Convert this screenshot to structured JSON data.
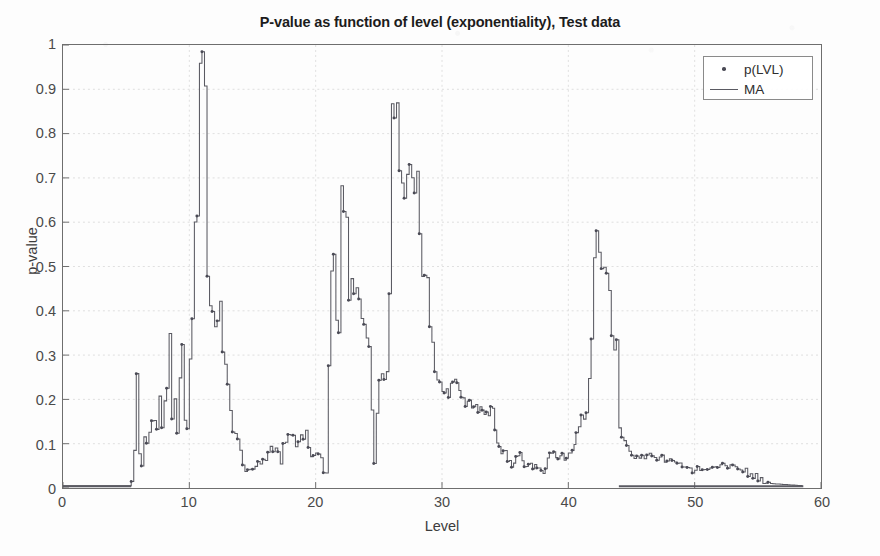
{
  "chart_data": {
    "type": "line",
    "title": "P-value as function of level (exponentiality), Test data",
    "xlabel": "Level",
    "ylabel": "p-value",
    "xlim": [
      0,
      60
    ],
    "ylim": [
      0,
      1
    ],
    "xticks": [
      0,
      10,
      20,
      30,
      40,
      50,
      60
    ],
    "yticks": [
      0,
      0.1,
      0.2,
      0.3,
      0.4,
      0.5,
      0.6,
      0.7,
      0.8,
      0.9,
      1
    ],
    "grid": true,
    "legend_position": "top-right",
    "legend": [
      "p(LVL)",
      "MA"
    ],
    "series": [
      {
        "name": "p(LVL)",
        "marker": "dot",
        "style": "markers",
        "color": "#4a4a55"
      },
      {
        "name": "MA",
        "marker": "none",
        "style": "line",
        "color": "#5a5a62"
      }
    ],
    "x": [
      0.0,
      0.5,
      1.0,
      1.5,
      2.0,
      2.5,
      3.0,
      3.5,
      4.0,
      4.5,
      5.0,
      5.4,
      5.6,
      5.8,
      6.0,
      6.2,
      6.4,
      6.6,
      6.8,
      7.0,
      7.2,
      7.4,
      7.6,
      7.8,
      8.0,
      8.2,
      8.4,
      8.6,
      8.8,
      9.0,
      9.2,
      9.4,
      9.6,
      9.8,
      10.0,
      10.2,
      10.4,
      10.6,
      10.8,
      11.0,
      11.2,
      11.4,
      11.6,
      11.8,
      12.0,
      12.2,
      12.4,
      12.6,
      12.8,
      13.0,
      13.2,
      13.4,
      13.6,
      13.8,
      14.0,
      14.4,
      14.8,
      15.2,
      15.6,
      16.0,
      16.4,
      16.8,
      17.2,
      17.6,
      18.0,
      18.4,
      18.8,
      19.2,
      19.6,
      20.0,
      20.4,
      20.8,
      21.0,
      21.2,
      21.4,
      21.6,
      21.8,
      22.0,
      22.2,
      22.4,
      22.6,
      22.8,
      23.0,
      23.4,
      23.8,
      24.2,
      24.6,
      25.0,
      25.2,
      25.4,
      25.6,
      25.8,
      26.0,
      26.4,
      26.8,
      27.2,
      27.6,
      28.0,
      28.4,
      28.8,
      29.2,
      29.6,
      30.0,
      30.5,
      31.0,
      31.5,
      32.0,
      32.5,
      33.0,
      33.5,
      34.0,
      34.5,
      35.0,
      35.5,
      36.0,
      36.5,
      37.0,
      37.5,
      38.0,
      38.5,
      39.0,
      39.5,
      40.0,
      40.3,
      40.6,
      41.0,
      41.4,
      41.8,
      42.2,
      42.6,
      43.0,
      43.4,
      43.8,
      44.0,
      45.0,
      47.0,
      50.0,
      53.0,
      56.0,
      58.5
    ],
    "y": [
      0.005,
      0.005,
      0.005,
      0.005,
      0.005,
      0.005,
      0.005,
      0.005,
      0.005,
      0.005,
      0.005,
      0.005,
      0.075,
      0.26,
      0.08,
      0.045,
      0.105,
      0.1,
      0.12,
      0.16,
      0.155,
      0.145,
      0.195,
      0.145,
      0.2,
      0.245,
      0.35,
      0.17,
      0.205,
      0.135,
      0.265,
      0.33,
      0.14,
      0.12,
      0.305,
      0.4,
      0.595,
      0.625,
      0.92,
      0.955,
      0.905,
      0.5,
      0.42,
      0.415,
      0.385,
      0.36,
      0.42,
      0.305,
      0.265,
      0.235,
      0.19,
      0.135,
      0.115,
      0.1,
      0.095,
      0.03,
      0.04,
      0.055,
      0.06,
      0.06,
      0.085,
      0.1,
      0.065,
      0.115,
      0.13,
      0.1,
      0.12,
      0.12,
      0.065,
      0.085,
      0.06,
      0.015,
      0.295,
      0.515,
      0.52,
      0.4,
      0.37,
      0.65,
      0.645,
      0.6,
      0.45,
      0.49,
      0.465,
      0.43,
      0.39,
      0.305,
      0.06,
      0.255,
      0.26,
      0.25,
      0.235,
      0.47,
      0.845,
      0.835,
      0.66,
      0.705,
      0.695,
      0.7,
      0.5,
      0.455,
      0.32,
      0.245,
      0.235,
      0.22,
      0.245,
      0.22,
      0.19,
      0.185,
      0.18,
      0.17,
      0.175,
      0.085,
      0.075,
      0.045,
      0.08,
      0.055,
      0.05,
      0.05,
      0.03,
      0.075,
      0.075,
      0.07,
      0.075,
      0.075,
      0.13,
      0.175,
      0.155,
      0.355,
      0.615,
      0.51,
      0.515,
      0.325,
      0.325,
      0.135,
      0.07,
      0.07,
      0.04,
      0.05,
      0.01,
      0.005,
      0.005,
      0.005,
      0.005,
      0.005,
      0.005
    ]
  }
}
